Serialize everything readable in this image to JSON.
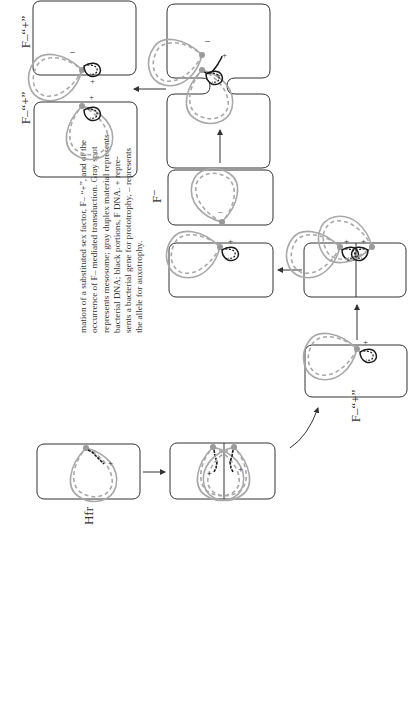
{
  "page_number": "125",
  "caption": {
    "lines": [
      "mation of a substituted sex factor, F– “+”, and of the",
      "occurrence of F– mediated transduction. Gray spot",
      "represents mesosome; gray duplex material represents",
      "bacterial DNA; black portions, F DNA. + repre-",
      "sents a bacterial gene for prototrophy, – represents",
      "the allele for auxotrophy."
    ]
  },
  "labels": {
    "hfr": "Hfr",
    "f_plus_lower": "F–“+”",
    "f_minus": "F⁻",
    "f_plus_top_a": "F–“+”",
    "f_plus_top_b": "F–“+”"
  },
  "symbols": {
    "plus": "+",
    "minus": "–"
  },
  "colors": {
    "bacterial_dna": "#a8a8a8",
    "f_dna": "#1a1a1a",
    "mesosome": "#9a9a9a",
    "cell_outline": "#333333"
  },
  "stages": [
    {
      "id": "hfr",
      "label": "Hfr"
    },
    {
      "id": "hfr-dividing",
      "label": ""
    },
    {
      "id": "f-plus-excised",
      "label": "F–“+”"
    },
    {
      "id": "f-plus-dividing",
      "label": ""
    },
    {
      "id": "f-plus-daughter",
      "label": ""
    },
    {
      "id": "f-minus-recipient",
      "label": "F⁻"
    },
    {
      "id": "conjugation",
      "label": ""
    },
    {
      "id": "transductant-a",
      "label": "F–“+”"
    },
    {
      "id": "transductant-b",
      "label": "F–“+”"
    }
  ]
}
